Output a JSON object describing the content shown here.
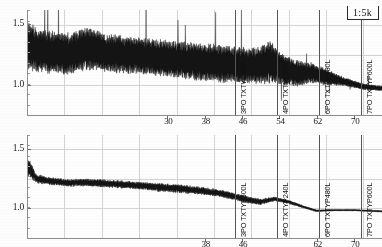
{
  "figure": {
    "scale_badge": "1:5k",
    "panel_count": 2
  },
  "chart_data": {
    "type": "line",
    "title": "",
    "subtitle": "",
    "xlabel": "",
    "ylabel": "",
    "grid": true,
    "legend": "none",
    "panels": [
      {
        "name": "top-panel",
        "ylim": [
          0.75,
          1.62
        ],
        "ytick_labels": [
          "1.5",
          "1.0"
        ],
        "ytick_values": [
          1.5,
          1.0
        ],
        "xlim": [
          0,
          76
        ],
        "xtick_labels": [
          "30",
          "38",
          "46",
          "54",
          "62",
          "70"
        ],
        "xtick_values": [
          30,
          38,
          46,
          54,
          62,
          70
        ],
        "gridlines_x": [
          8,
          16,
          24,
          32,
          40,
          48,
          56,
          64,
          72
        ],
        "gridlines_y": [
          1.5,
          1.25,
          1.0
        ],
        "series_name": "trace-top",
        "series_description": "dense noisy band decaying from 1.45 to 0.97",
        "envelope": [
          {
            "x": 0.5,
            "hi": 1.52,
            "lo": 1.12
          },
          {
            "x": 2,
            "hi": 1.46,
            "lo": 1.12
          },
          {
            "x": 5,
            "hi": 1.44,
            "lo": 1.1
          },
          {
            "x": 9,
            "hi": 1.42,
            "lo": 1.09
          },
          {
            "x": 13,
            "hi": 1.48,
            "lo": 1.13
          },
          {
            "x": 17,
            "hi": 1.42,
            "lo": 1.11
          },
          {
            "x": 21,
            "hi": 1.4,
            "lo": 1.1
          },
          {
            "x": 25,
            "hi": 1.38,
            "lo": 1.09
          },
          {
            "x": 29,
            "hi": 1.37,
            "lo": 1.07
          },
          {
            "x": 33,
            "hi": 1.36,
            "lo": 1.06
          },
          {
            "x": 37,
            "hi": 1.34,
            "lo": 1.04
          },
          {
            "x": 41,
            "hi": 1.33,
            "lo": 1.03
          },
          {
            "x": 45,
            "hi": 1.31,
            "lo": 1.02
          },
          {
            "x": 49,
            "hi": 1.3,
            "lo": 1.01
          },
          {
            "x": 52,
            "hi": 1.36,
            "lo": 1.02
          },
          {
            "x": 55,
            "hi": 1.24,
            "lo": 1.0
          },
          {
            "x": 58,
            "hi": 1.2,
            "lo": 0.99
          },
          {
            "x": 61,
            "hi": 1.18,
            "lo": 1.02
          },
          {
            "x": 64,
            "hi": 1.13,
            "lo": 1.0
          },
          {
            "x": 68,
            "hi": 1.06,
            "lo": 0.99
          },
          {
            "x": 72,
            "hi": 1.01,
            "lo": 0.96
          },
          {
            "x": 76,
            "hi": 0.99,
            "lo": 0.95
          }
        ],
        "markers": [
          {
            "x": 44.5,
            "label": "3PO TXTYP600L",
            "tick": "38"
          },
          {
            "x": 53.5,
            "label": "4PO TXTYP240L",
            "tick": "46"
          },
          {
            "x": 62.5,
            "label": "6PO TXTYP480L",
            "tick": "62"
          },
          {
            "x": 71.5,
            "label": "7PO TXTYP600L",
            "tick": "70"
          }
        ]
      },
      {
        "name": "bottom-panel",
        "ylim": [
          0.75,
          1.62
        ],
        "ytick_labels": [
          "1.5",
          "1.0"
        ],
        "ytick_values": [
          1.5,
          1.0
        ],
        "xlim": [
          0,
          76
        ],
        "xtick_labels": [
          "38",
          "46",
          "62",
          "70"
        ],
        "xtick_values": [
          38,
          46,
          62,
          70
        ],
        "gridlines_x": [
          8,
          16,
          24,
          32,
          40,
          48,
          56,
          64,
          72
        ],
        "gridlines_y": [
          1.5,
          1.25,
          1.0
        ],
        "series_name": "trace-bottom",
        "series_description": "smoother noisy band decaying from 1.40 to 0.96",
        "envelope": [
          {
            "x": 0.5,
            "hi": 1.5,
            "lo": 1.18
          },
          {
            "x": 2,
            "hi": 1.33,
            "lo": 1.17
          },
          {
            "x": 5,
            "hi": 1.3,
            "lo": 1.16
          },
          {
            "x": 9,
            "hi": 1.28,
            "lo": 1.15
          },
          {
            "x": 13,
            "hi": 1.29,
            "lo": 1.15
          },
          {
            "x": 17,
            "hi": 1.28,
            "lo": 1.14
          },
          {
            "x": 21,
            "hi": 1.27,
            "lo": 1.13
          },
          {
            "x": 25,
            "hi": 1.26,
            "lo": 1.12
          },
          {
            "x": 29,
            "hi": 1.25,
            "lo": 1.1
          },
          {
            "x": 33,
            "hi": 1.24,
            "lo": 1.09
          },
          {
            "x": 37,
            "hi": 1.22,
            "lo": 1.08
          },
          {
            "x": 41,
            "hi": 1.2,
            "lo": 1.06
          },
          {
            "x": 44,
            "hi": 1.17,
            "lo": 1.04
          },
          {
            "x": 47,
            "hi": 1.14,
            "lo": 1.01
          },
          {
            "x": 50,
            "hi": 1.11,
            "lo": 1.0
          },
          {
            "x": 53,
            "hi": 1.12,
            "lo": 1.04
          },
          {
            "x": 56,
            "hi": 1.09,
            "lo": 1.02
          },
          {
            "x": 59,
            "hi": 1.04,
            "lo": 0.99
          },
          {
            "x": 62,
            "hi": 1.0,
            "lo": 0.96
          },
          {
            "x": 66,
            "hi": 1.0,
            "lo": 0.97
          },
          {
            "x": 70,
            "hi": 1.0,
            "lo": 0.97
          },
          {
            "x": 76,
            "hi": 0.99,
            "lo": 0.96
          }
        ],
        "markers": [
          {
            "x": 44.5,
            "label": "3PO TXTYP600L",
            "tick": "38"
          },
          {
            "x": 53.5,
            "label": "4PO TXTYP240L",
            "tick": "46"
          },
          {
            "x": 62.5,
            "label": "6PO TXTYP480L",
            "tick": "62"
          },
          {
            "x": 71.5,
            "label": "7PO TXTYP600L",
            "tick": "70"
          }
        ]
      }
    ]
  },
  "colors": {
    "trace": "#141414",
    "grid": "#d3d3d6",
    "axis": "#8d8d90",
    "marker": "#55555a",
    "text": "#1a1a1a",
    "background": "#fdfdfd"
  }
}
